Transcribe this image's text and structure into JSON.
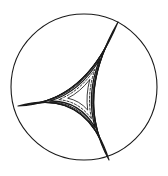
{
  "figure": {
    "background_color": "#ffffff",
    "stroke_color": "#1a1a1a",
    "canvas": {
      "width": 168,
      "height": 176
    }
  },
  "chart_data": {
    "type": "scatter",
    "subtitle": "",
    "xlabel": "",
    "ylabel": "",
    "xlim": [
      0,
      168
    ],
    "ylim": [
      0,
      176
    ],
    "grid": false,
    "legend": null,
    "annotations": [],
    "tick_labels": {
      "x": [],
      "y": []
    },
    "boundary_circle": {
      "name": "unit-disk-boundary",
      "cx": 84,
      "cy": 87,
      "r": 73,
      "stroke": "#1a1a1a",
      "stroke_width": 1.1,
      "dashed": false
    },
    "cusps": [
      {
        "name": "cusp-top-right",
        "x": 118,
        "y": 22
      },
      {
        "name": "cusp-left",
        "x": 18,
        "y": 106
      },
      {
        "name": "cusp-bottom",
        "x": 109,
        "y": 160
      }
    ],
    "series": [
      {
        "name": "triangle-1-outermost",
        "type": "hyperbolic-triangle",
        "bulge": 0.62,
        "scale": 1.0,
        "dashed": false,
        "stroke_width": 1.15,
        "values": [
          118,
          22,
          18,
          106,
          109,
          160
        ]
      },
      {
        "name": "triangle-2",
        "type": "hyperbolic-triangle",
        "bulge": 0.56,
        "scale": 0.88,
        "dashed": false,
        "stroke_width": 1.05,
        "values": [
          118,
          22,
          18,
          106,
          109,
          160
        ]
      },
      {
        "name": "triangle-3",
        "type": "hyperbolic-triangle",
        "bulge": 0.5,
        "scale": 0.75,
        "dashed": false,
        "stroke_width": 1.0,
        "values": [
          118,
          22,
          18,
          106,
          109,
          160
        ]
      },
      {
        "name": "triangle-4",
        "type": "hyperbolic-triangle",
        "bulge": 0.44,
        "scale": 0.62,
        "dashed": false,
        "stroke_width": 0.95,
        "values": [
          118,
          22,
          18,
          106,
          109,
          160
        ]
      },
      {
        "name": "triangle-5",
        "type": "hyperbolic-triangle",
        "bulge": 0.38,
        "scale": 0.5,
        "dashed": false,
        "stroke_width": 1.3,
        "values": [
          118,
          22,
          18,
          106,
          109,
          160
        ]
      },
      {
        "name": "triangle-6-dashed",
        "type": "hyperbolic-triangle",
        "bulge": 0.3,
        "scale": 0.36,
        "dashed": true,
        "stroke_width": 0.9,
        "values": [
          118,
          22,
          18,
          106,
          109,
          160
        ]
      },
      {
        "name": "triangle-7-innermost",
        "type": "hyperbolic-triangle",
        "bulge": 0.22,
        "scale": 0.22,
        "dashed": false,
        "stroke_width": 0.85,
        "values": [
          118,
          22,
          18,
          106,
          109,
          160
        ]
      }
    ],
    "centroid": {
      "x": 81.7,
      "y": 96.0
    }
  }
}
